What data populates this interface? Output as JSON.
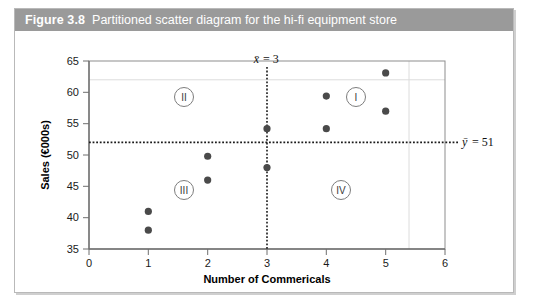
{
  "figure": {
    "number": "Figure 3.8",
    "caption": "Partitioned scatter diagram for the hi-fi equipment store",
    "caption_bar_color": "#9a9a9a",
    "frame_border_color": "#b9b9b9"
  },
  "chart_data": {
    "type": "scatter",
    "title": "Partitioned scatter diagram for the hi-fi equipment store",
    "xlabel": "Number of Commericals",
    "ylabel": "Sales (€000s)",
    "xlim": [
      0,
      6
    ],
    "ylim": [
      35,
      65
    ],
    "xticks": [
      "0",
      "1",
      "2",
      "3",
      "4",
      "5",
      "6"
    ],
    "yticks": [
      "35",
      "40",
      "45",
      "50",
      "55",
      "60",
      "65"
    ],
    "grid": false,
    "legend": "none",
    "marker_color": "#4a4a4a",
    "points": [
      {
        "x": 1,
        "y": 41
      },
      {
        "x": 1,
        "y": 38
      },
      {
        "x": 2,
        "y": 49.8
      },
      {
        "x": 2,
        "y": 46
      },
      {
        "x": 3,
        "y": 54.2
      },
      {
        "x": 3,
        "y": 48
      },
      {
        "x": 4,
        "y": 59.4
      },
      {
        "x": 4,
        "y": 54.2
      },
      {
        "x": 5,
        "y": 63.1
      },
      {
        "x": 5,
        "y": 57
      }
    ],
    "reference_lines": [
      {
        "name": "x-mean",
        "orientation": "vertical",
        "value": 3,
        "label": "x̄ = 3",
        "style": "dotted"
      },
      {
        "name": "y-mean",
        "orientation": "horizontal",
        "value": 51,
        "label": "ȳ = 51",
        "style": "dotted"
      }
    ],
    "annotations": [
      {
        "name": "quadrant-1",
        "label": "I",
        "x": 4.5,
        "y": 58.6
      },
      {
        "name": "quadrant-2",
        "label": "II",
        "x": 1.6,
        "y": 58.6
      },
      {
        "name": "quadrant-3",
        "label": "III",
        "x": 1.6,
        "y": 43.8
      },
      {
        "name": "quadrant-4",
        "label": "IV",
        "x": 4.2,
        "y": 43.8
      }
    ]
  },
  "labels": {
    "x_mean_symbol": "x̄",
    "x_mean_text": "= 3",
    "y_mean_symbol": "ȳ",
    "y_mean_text": "= 51",
    "quadrant_1": "I",
    "quadrant_2": "II",
    "quadrant_3": "III",
    "quadrant_4": "IV"
  }
}
